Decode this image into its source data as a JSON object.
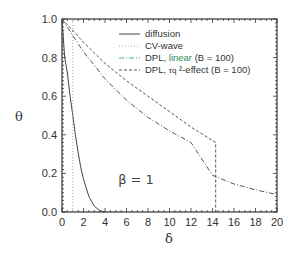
{
  "chart_data": {
    "type": "line",
    "title": "",
    "xlabel": "δ",
    "ylabel": "θ",
    "xlim": [
      0,
      20
    ],
    "ylim": [
      0.0,
      1.0
    ],
    "xticks": [
      "0",
      "2",
      "4",
      "6",
      "8",
      "10",
      "12",
      "14",
      "16",
      "18",
      "20"
    ],
    "yticks": [
      "0.0",
      "0.2",
      "0.4",
      "0.6",
      "0.8",
      "1.0"
    ],
    "grid": false,
    "legend_position": "upper right",
    "annotation": "β = 1",
    "series": [
      {
        "name": "diffusion",
        "style": "solid",
        "color": "#444444",
        "x": [
          0,
          0.25,
          0.5,
          0.75,
          1.0,
          1.25,
          1.5,
          1.75,
          2.0,
          2.5,
          3.0,
          3.5,
          4.0
        ],
        "y": [
          1.0,
          0.8,
          0.72,
          0.6,
          0.5,
          0.4,
          0.31,
          0.23,
          0.17,
          0.08,
          0.03,
          0.008,
          0.0
        ]
      },
      {
        "name": "CV-wave",
        "style": "dotted",
        "color": "#aaaaaa",
        "x": [
          1.0,
          1.0
        ],
        "y": [
          1.0,
          0.0
        ]
      },
      {
        "name": "DPL, linear (B = 100)",
        "style": "dashdot",
        "color": "#555555",
        "x": [
          0,
          2,
          4,
          6,
          8,
          10,
          12,
          14,
          16,
          18,
          20
        ],
        "y": [
          1.0,
          0.83,
          0.69,
          0.58,
          0.49,
          0.42,
          0.36,
          0.19,
          0.145,
          0.115,
          0.09
        ]
      },
      {
        "name": "DPL, τq ²-effect (B = 100)",
        "style": "dashed",
        "color": "#555555",
        "x": [
          0,
          2,
          4,
          6,
          8,
          10,
          12,
          14,
          14.3,
          14.3
        ],
        "y": [
          1.0,
          0.88,
          0.77,
          0.68,
          0.6,
          0.52,
          0.44,
          0.37,
          0.36,
          0.0
        ]
      }
    ]
  },
  "legend": {
    "items": [
      {
        "label": "diffusion"
      },
      {
        "label": "CV-wave"
      },
      {
        "label_prefix": "DPL, ",
        "label_colored": "linear",
        "label_suffix": " (B = 100)",
        "color": "#2e8b57"
      },
      {
        "label_prefix": "DPL, ",
        "label_tau": "τq",
        "label_suffix": " ²-effect (B = 100)"
      }
    ]
  }
}
